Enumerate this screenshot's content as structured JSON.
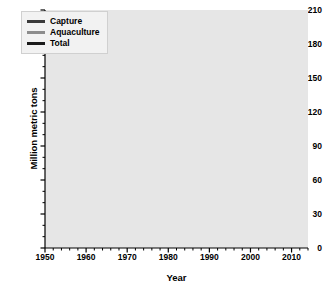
{
  "chart_data": {
    "type": "line",
    "title": "",
    "xlabel": "Year",
    "ylabel": "Million metric tons",
    "xlim": [
      1950,
      2014
    ],
    "ylim": [
      0,
      210
    ],
    "grid": true,
    "legend_position": "top-left",
    "ytick_labels": [
      "210",
      "180",
      "150",
      "120",
      "90",
      "60",
      "30",
      "0"
    ],
    "ytick_values": [
      210,
      180,
      150,
      120,
      90,
      60,
      30,
      0
    ],
    "xtick_labels": [
      "1950",
      "1960",
      "1970",
      "1980",
      "1990",
      "2000",
      "2010"
    ],
    "xtick_values": [
      1950,
      1960,
      1970,
      1980,
      1990,
      2000,
      2010
    ],
    "x": [
      1950,
      1951,
      1952,
      1953,
      1954,
      1955,
      1956,
      1957,
      1958,
      1959,
      1960,
      1961,
      1962,
      1963,
      1964,
      1965,
      1966,
      1967,
      1968,
      1969,
      1970,
      1971,
      1972,
      1973,
      1974,
      1975,
      1976,
      1977,
      1978,
      1979,
      1980,
      1981,
      1982,
      1983,
      1984,
      1985,
      1986,
      1987,
      1988,
      1989,
      1990,
      1991,
      1992,
      1993,
      1994,
      1995,
      1996,
      1997,
      1998,
      1999,
      2000,
      2001,
      2002,
      2003,
      2004,
      2005,
      2006,
      2007,
      2008,
      2009,
      2010,
      2011,
      2012,
      2013,
      2014
    ],
    "series": [
      {
        "name": "Capture",
        "color": "#3a3a3a",
        "values": [
          19.3,
          22.0,
          23.0,
          24.0,
          25.5,
          27.0,
          28.5,
          29.0,
          30.0,
          32.0,
          34.0,
          36.5,
          39.0,
          40.5,
          45.0,
          46.5,
          50.0,
          53.0,
          56.5,
          56.0,
          60.5,
          58.0,
          55.0,
          57.5,
          60.5,
          59.5,
          62.5,
          61.5,
          63.0,
          64.5,
          64.5,
          66.5,
          68.0,
          68.5,
          74.0,
          75.0,
          80.0,
          80.5,
          85.5,
          84.5,
          79.5,
          78.0,
          79.5,
          80.5,
          85.0,
          85.5,
          87.5,
          87.0,
          79.0,
          86.0,
          89.0,
          87.0,
          86.0,
          84.0,
          88.0,
          87.0,
          85.0,
          86.0,
          85.5,
          85.5,
          86.5,
          88.5,
          88.5,
          89.5,
          93.0
        ]
      },
      {
        "name": "Aquaculture",
        "color": "#8c8c8c",
        "values": [
          0.6,
          0.7,
          0.8,
          0.9,
          1.0,
          1.1,
          1.2,
          1.3,
          1.4,
          1.5,
          1.6,
          1.7,
          1.8,
          1.9,
          2.0,
          2.1,
          2.2,
          2.4,
          2.6,
          2.8,
          3.0,
          3.2,
          3.4,
          3.7,
          4.0,
          4.4,
          4.8,
          5.2,
          5.8,
          6.4,
          7.0,
          7.8,
          8.5,
          9.4,
          10.5,
          11.5,
          12.8,
          14.5,
          16.0,
          17.5,
          19.0,
          21.0,
          23.5,
          26.5,
          30.0,
          33.5,
          36.5,
          39.5,
          42.5,
          45.5,
          47.5,
          49.5,
          51.5,
          54.0,
          57.0,
          60.0,
          64.0,
          62.5,
          66.0,
          69.0,
          72.5,
          76.0,
          80.0,
          85.0,
          93.0
        ]
      },
      {
        "name": "Total",
        "color": "#1a1a1a",
        "values": [
          19.9,
          22.7,
          23.8,
          24.9,
          26.5,
          28.1,
          29.7,
          30.3,
          31.4,
          33.5,
          35.6,
          38.2,
          40.8,
          42.4,
          47.0,
          48.6,
          52.2,
          55.4,
          59.1,
          58.8,
          63.5,
          61.2,
          58.4,
          61.2,
          64.5,
          63.9,
          67.3,
          66.7,
          68.8,
          70.9,
          71.5,
          74.3,
          76.5,
          77.9,
          84.5,
          86.5,
          92.8,
          95.0,
          101.5,
          102.0,
          98.5,
          99.0,
          103.0,
          107.0,
          115.0,
          119.0,
          124.0,
          126.5,
          121.5,
          131.5,
          136.5,
          136.5,
          137.5,
          138.0,
          145.0,
          147.0,
          149.0,
          148.5,
          151.5,
          154.5,
          159.0,
          164.5,
          168.5,
          174.5,
          186.0
        ]
      }
    ]
  },
  "legend": {
    "items": [
      {
        "label": "Capture",
        "color": "#3a3a3a"
      },
      {
        "label": "Aquaculture",
        "color": "#8c8c8c"
      },
      {
        "label": "Total",
        "color": "#1a1a1a"
      }
    ]
  }
}
